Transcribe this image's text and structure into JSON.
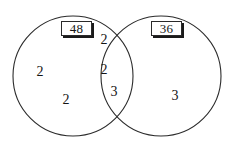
{
  "diagram": {
    "type": "venn-two-set",
    "title": "",
    "background_color": "#ffffff",
    "stroke_color": "#2b2b2b",
    "text_color": "#141414"
  },
  "sets": {
    "left": {
      "label": "48",
      "label_boxed": true,
      "circle": {
        "cx": 73,
        "cy": 76,
        "r": 60
      }
    },
    "right": {
      "label": "36",
      "label_boxed": true,
      "circle": {
        "cx": 161,
        "cy": 76,
        "r": 60
      }
    }
  },
  "regions": {
    "left_only": {
      "name": "left-only-region",
      "values": [
        "2",
        "2"
      ],
      "positions": [
        {
          "x": 40,
          "y": 72
        },
        {
          "x": 66,
          "y": 100
        }
      ]
    },
    "intersection": {
      "name": "intersection-region",
      "values": [
        "2",
        "2",
        "3"
      ],
      "positions": [
        {
          "x": 104,
          "y": 40
        },
        {
          "x": 104,
          "y": 70
        },
        {
          "x": 114,
          "y": 92
        }
      ]
    },
    "right_only": {
      "name": "right-only-region",
      "values": [
        "3"
      ],
      "positions": [
        {
          "x": 175,
          "y": 96
        }
      ]
    }
  },
  "chart_data": {
    "type": "venn",
    "title": "",
    "sets": [
      "48",
      "36"
    ],
    "left_only": [
      "2",
      "2"
    ],
    "intersection": [
      "2",
      "2",
      "3"
    ],
    "right_only": [
      "3"
    ],
    "legend": "none",
    "grid": false
  }
}
